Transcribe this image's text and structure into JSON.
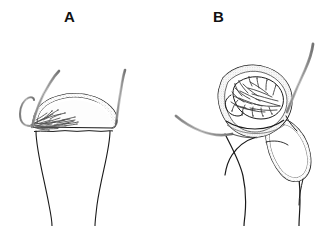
{
  "figure": {
    "kind": "anatomical-line-drawing",
    "background_color": "#ffffff",
    "width": 328,
    "height": 226,
    "panel_count": 2
  },
  "panels": [
    {
      "id": "panel-a",
      "label": "A",
      "label_x": 64,
      "label_y": 9,
      "subject": "long-bone-epiphysis-with-physis-and-vascular-tuft"
    },
    {
      "id": "panel-b",
      "label": "B",
      "label_x": 213,
      "label_y": 9,
      "subject": "proximal-femur-head-neck-greater-trochanter-with-vessels"
    }
  ],
  "colors": {
    "outline": "#1a1a1a",
    "vessel_stroke": "#6e6e6e",
    "vessel_fill": "#d9d9d9",
    "cartilage_fill": "#ffffff",
    "stipple_fill": "#ededed",
    "marrow_fill": "#e4e4e4",
    "background": "#ffffff",
    "label_color": "#111111"
  },
  "strokes": {
    "outline_width": 1.1,
    "vessel_width": 2.2,
    "fine_width": 0.8
  }
}
